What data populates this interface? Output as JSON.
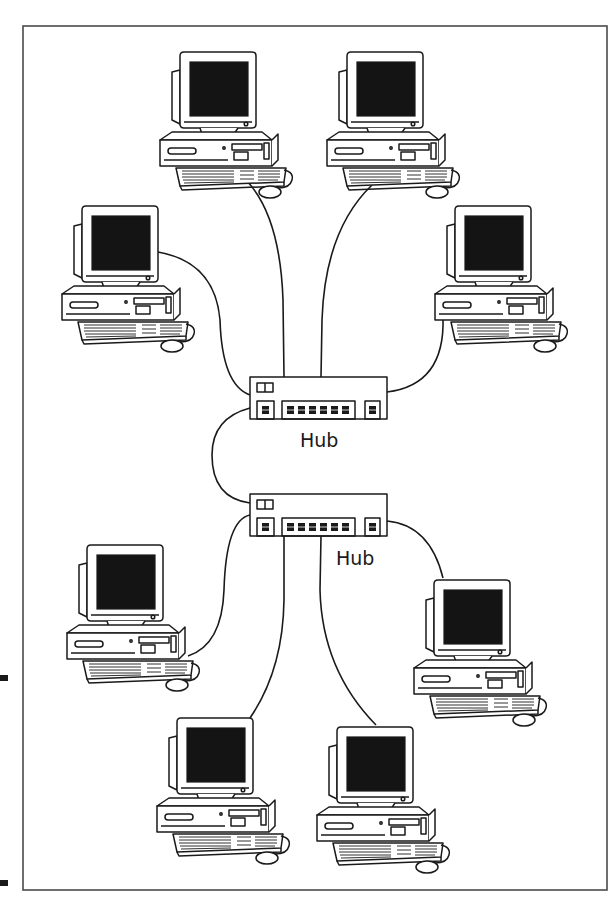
{
  "diagram": {
    "type": "network-topology",
    "title": "",
    "frame": {
      "x": 23,
      "y": 26,
      "width": 584,
      "height": 864,
      "stroke": "#4a4a4a"
    },
    "margin_marks": [
      {
        "x": 0,
        "y": 675,
        "width": 8,
        "height": 6
      },
      {
        "x": 0,
        "y": 880,
        "width": 8,
        "height": 6
      }
    ],
    "colors": {
      "ink": "#1a1a1a",
      "screen": "#141414",
      "background": "#ffffff"
    },
    "hubs": [
      {
        "id": "hub-1",
        "label": "Hub",
        "x": 250,
        "y": 377,
        "width": 137,
        "height": 42,
        "label_x": 300,
        "label_y": 447
      },
      {
        "id": "hub-2",
        "label": "Hub",
        "x": 250,
        "y": 494,
        "width": 137,
        "height": 42,
        "label_x": 336,
        "label_y": 565
      }
    ],
    "computers": [
      {
        "id": "pc-1",
        "x": 158,
        "y": 52,
        "hub": "hub-1"
      },
      {
        "id": "pc-2",
        "x": 325,
        "y": 52,
        "hub": "hub-1"
      },
      {
        "id": "pc-3",
        "x": 60,
        "y": 205,
        "hub": "hub-1"
      },
      {
        "id": "pc-4",
        "x": 433,
        "y": 205,
        "hub": "hub-1"
      },
      {
        "id": "pc-5",
        "x": 65,
        "y": 545,
        "hub": "hub-2"
      },
      {
        "id": "pc-6",
        "x": 410,
        "y": 578,
        "hub": "hub-2"
      },
      {
        "id": "pc-7",
        "x": 155,
        "y": 716,
        "hub": "hub-2"
      },
      {
        "id": "pc-8",
        "x": 315,
        "y": 725,
        "hub": "hub-2"
      }
    ],
    "links": [
      {
        "from": "pc-1",
        "to": "hub-1"
      },
      {
        "from": "pc-2",
        "to": "hub-1"
      },
      {
        "from": "pc-3",
        "to": "hub-1"
      },
      {
        "from": "pc-4",
        "to": "hub-1"
      },
      {
        "from": "hub-1",
        "to": "hub-2"
      },
      {
        "from": "pc-5",
        "to": "hub-2"
      },
      {
        "from": "pc-6",
        "to": "hub-2"
      },
      {
        "from": "pc-7",
        "to": "hub-2"
      },
      {
        "from": "pc-8",
        "to": "hub-2"
      }
    ]
  }
}
